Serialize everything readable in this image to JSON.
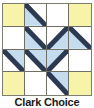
{
  "figure": {
    "kind": "quilt-block-diagram",
    "width": 94,
    "height": 108
  },
  "caption": {
    "text": "Clark Choice"
  },
  "palette": {
    "yellow": "#F7F3A8",
    "blue": "#C5DCEF",
    "white": "#FFFFFF",
    "line": "#6F6F66",
    "border": "#7D7D72",
    "diagonal": "#2B3A52"
  },
  "block": {
    "name": "Clark Choice",
    "rows": 4,
    "cols": 4,
    "cells": [
      {
        "row": 0,
        "col": 0,
        "fill": "yellow",
        "shape": "solid"
      },
      {
        "row": 0,
        "col": 1,
        "fill": "blue",
        "base": "white",
        "shape": "triangle-bottom-left"
      },
      {
        "row": 0,
        "col": 2,
        "fill": "white",
        "shape": "solid"
      },
      {
        "row": 0,
        "col": 3,
        "fill": "yellow",
        "shape": "solid"
      },
      {
        "row": 1,
        "col": 0,
        "fill": "white",
        "shape": "solid"
      },
      {
        "row": 1,
        "col": 1,
        "fill": "blue",
        "base": "white",
        "shape": "triangle-bottom-left"
      },
      {
        "row": 1,
        "col": 2,
        "fill": "blue",
        "base": "white",
        "shape": "triangle-bottom-right"
      },
      {
        "row": 1,
        "col": 3,
        "fill": "blue",
        "base": "white",
        "shape": "triangle-bottom-left"
      },
      {
        "row": 2,
        "col": 0,
        "fill": "blue",
        "base": "white",
        "shape": "triangle-top-right"
      },
      {
        "row": 2,
        "col": 1,
        "fill": "blue",
        "base": "white",
        "shape": "triangle-top-right"
      },
      {
        "row": 2,
        "col": 2,
        "fill": "blue",
        "base": "white",
        "shape": "triangle-top-left"
      },
      {
        "row": 2,
        "col": 3,
        "fill": "white",
        "shape": "solid"
      },
      {
        "row": 3,
        "col": 0,
        "fill": "yellow",
        "shape": "solid"
      },
      {
        "row": 3,
        "col": 1,
        "fill": "white",
        "shape": "solid"
      },
      {
        "row": 3,
        "col": 2,
        "fill": "blue",
        "base": "white",
        "shape": "triangle-top-right"
      },
      {
        "row": 3,
        "col": 3,
        "fill": "yellow",
        "shape": "solid"
      }
    ]
  }
}
